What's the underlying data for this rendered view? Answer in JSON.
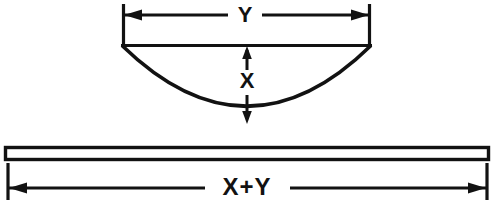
{
  "diagram": {
    "background_color": "#ffffff",
    "ink_color": "#121212",
    "labels": {
      "top_dimension": "Y",
      "vertical_dimension": "X",
      "bottom_dimension": "X+Y"
    },
    "shapes": {
      "arc": {
        "name": "curved-segment",
        "chord_left_x": 122,
        "chord_right_x": 371,
        "chord_y": 45,
        "lowest_point_x": 247,
        "lowest_point_y": 124,
        "chord_length_px": 249,
        "sagitta_px": 79
      },
      "bar": {
        "name": "straight-bar",
        "left_x": 5,
        "right_x": 489,
        "top_y": 147,
        "bottom_y": 160,
        "length_px": 484
      }
    },
    "dimensions": [
      {
        "name": "top-width-dimension",
        "label": "Y",
        "axis": "horizontal",
        "line_y": 15,
        "from_x": 122,
        "to_x": 371,
        "extension_top_y": 4,
        "extension_bottom_y": 45
      },
      {
        "name": "depth-dimension",
        "label": "X",
        "axis": "vertical",
        "line_x": 247,
        "from_y": 46,
        "to_y": 124
      },
      {
        "name": "bottom-length-dimension",
        "label": "X+Y",
        "axis": "horizontal",
        "line_y": 188,
        "from_x": 7,
        "to_x": 487,
        "extension_top_y": 163,
        "extension_bottom_y": 200
      }
    ],
    "relationship": "The length of the straight bar (X+Y) equals the chord width (Y) plus the arc depth (X)."
  }
}
